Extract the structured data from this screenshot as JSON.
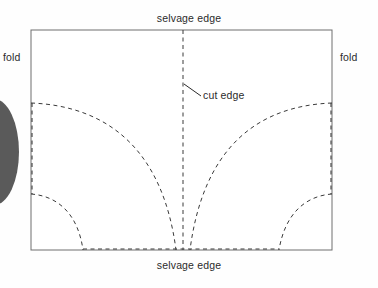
{
  "diagram": {
    "background_color": "#fefefe",
    "line_color": "#5a5a5a",
    "dash_color": "#3a3a3a",
    "text_color": "#2b2b2b",
    "ellipse_color": "#5a5a5a",
    "labels": {
      "selvage_edge_top": "selvage edge",
      "selvage_edge_bottom": "selvage edge",
      "fold_left": "fold",
      "fold_right": "fold",
      "cut_edge": "cut edge"
    },
    "geometry": {
      "rect_left": 31,
      "rect_top": 30,
      "rect_right": 332,
      "rect_bottom": 250,
      "center_x": 183,
      "big_arc_top_y": 103,
      "small_arc_top_y": 194,
      "small_arc_left_end_x": 83,
      "small_arc_right_end_x": 279
    }
  }
}
